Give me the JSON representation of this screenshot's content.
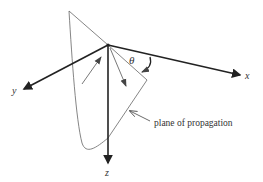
{
  "diagram": {
    "axes": {
      "x_label": "x",
      "y_label": "y",
      "z_label": "z"
    },
    "angle_label": "θ",
    "annotation": "plane of propagation",
    "colors": {
      "axis": "#222222",
      "line": "#555555",
      "text": "#333333"
    }
  }
}
